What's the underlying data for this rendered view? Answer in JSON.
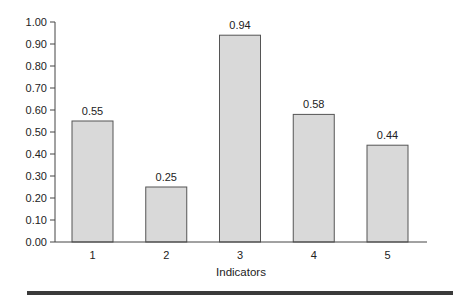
{
  "chart_data": {
    "type": "bar",
    "title": "",
    "xlabel": "Indicators",
    "ylabel": "",
    "categories": [
      "1",
      "2",
      "3",
      "4",
      "5"
    ],
    "values": [
      0.55,
      0.25,
      0.94,
      0.58,
      0.44
    ],
    "data_labels": [
      "0.55",
      "0.25",
      "0.94",
      "0.58",
      "0.44"
    ],
    "ylim": [
      0,
      1.0
    ],
    "yticks": [
      0.0,
      0.1,
      0.2,
      0.3,
      0.4,
      0.5,
      0.6,
      0.7,
      0.8,
      0.9,
      1.0
    ],
    "ytick_labels": [
      "0.00",
      "0.10",
      "0.20",
      "0.30",
      "0.40",
      "0.50",
      "0.60",
      "0.70",
      "0.80",
      "0.90",
      "1.00"
    ],
    "grid": false,
    "legend": null,
    "colors": {
      "bar_fill": "#d9d9d9",
      "bar_stroke": "#555555",
      "rule": "#3a3a3a"
    }
  }
}
